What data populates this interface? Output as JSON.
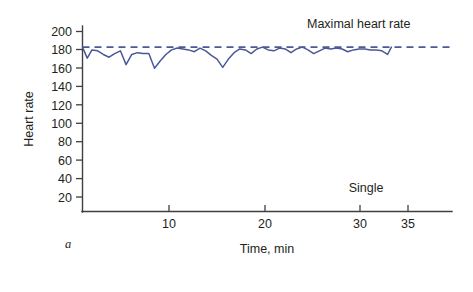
{
  "chart_data": {
    "type": "line",
    "title": "",
    "panel_label": "a",
    "xlabel": "Time, min",
    "ylabel": "Heart rate",
    "xlim": [
      0,
      39
    ],
    "ylim": [
      0,
      210
    ],
    "grid": false,
    "x_ticks": [
      10,
      20,
      30,
      35
    ],
    "x_tick_labels": [
      "10",
      "20",
      "30",
      "35"
    ],
    "y_ticks": [
      20,
      40,
      60,
      80,
      100,
      120,
      140,
      160,
      180,
      200
    ],
    "y_tick_labels": [
      "20",
      "40",
      "60",
      "80",
      "100",
      "120",
      "140",
      "160",
      "180",
      "200"
    ],
    "legend_position": "none",
    "annotations": [
      {
        "text": "Maximal heart rate",
        "x": 30.5,
        "y": 196
      },
      {
        "text": "Single",
        "x": 30.0,
        "y": 38
      }
    ],
    "series": [
      {
        "name": "Heart rate",
        "color": "#4a5899",
        "style": "solid",
        "x": [
          0.0,
          0.5,
          1.0,
          1.6,
          2.2,
          2.8,
          3.4,
          4.0,
          4.6,
          5.2,
          5.8,
          6.4,
          7.0,
          7.6,
          8.2,
          8.8,
          9.4,
          10.0,
          10.6,
          11.2,
          11.8,
          12.4,
          13.0,
          13.6,
          14.2,
          14.8,
          15.4,
          16.0,
          16.6,
          17.2,
          17.8,
          18.4,
          19.0,
          19.6,
          20.2,
          20.8,
          21.4,
          22.0,
          22.6,
          23.2,
          23.8,
          24.4,
          25.0,
          25.6,
          26.2,
          26.8,
          27.4,
          28.0,
          28.6,
          29.2,
          29.8,
          30.4,
          31.0,
          31.6,
          32.2,
          32.6
        ],
        "y": [
          183,
          171,
          180,
          179,
          175,
          172,
          176,
          179,
          164,
          175,
          177,
          176,
          176,
          160,
          168,
          175,
          180,
          182,
          181,
          180,
          178,
          182,
          179,
          174,
          170,
          161,
          170,
          177,
          181,
          180,
          176,
          181,
          183,
          180,
          179,
          182,
          181,
          177,
          181,
          183,
          180,
          176,
          179,
          182,
          181,
          182,
          181,
          178,
          180,
          181,
          181,
          180,
          180,
          179,
          175,
          183
        ]
      },
      {
        "name": "Maximal heart rate",
        "color": "#4a5899",
        "style": "dashed",
        "x": [
          0,
          39
        ],
        "y": [
          183,
          183
        ]
      }
    ]
  },
  "axes": {
    "y_axis_title": "Heart rate",
    "x_axis_title": "Time, min"
  },
  "labels": {
    "maximal_heart_rate": "Maximal heart rate",
    "single": "Single",
    "panel": "a"
  },
  "colors": {
    "series": "#4a5899",
    "axis": "#3f3f3f",
    "text": "#231f20",
    "background": "#ffffff"
  }
}
